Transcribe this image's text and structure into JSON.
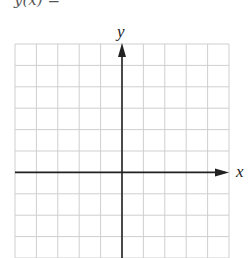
{
  "top_text": "y(x) = ",
  "grid": {
    "left": 15,
    "top": 44,
    "cell": 21.4,
    "columns": 10,
    "rows": 10,
    "grid_color": "#cfcfcf",
    "axis_color": "#222222"
  },
  "axes": {
    "x_label": "x",
    "y_label": "y",
    "origin_col": 5,
    "origin_row": 6
  }
}
